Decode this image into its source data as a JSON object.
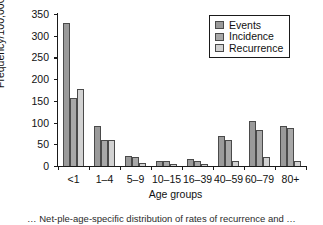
{
  "chart_data": {
    "type": "bar",
    "title": "",
    "xlabel": "Age groups",
    "ylabel": "Frequency/100,000",
    "categories": [
      "<1",
      "1–4",
      "5–9",
      "10–15",
      "16–39",
      "40–59",
      "60–79",
      "80+"
    ],
    "series": [
      {
        "name": "Events",
        "color": "#9a9a9a",
        "values": [
          330,
          93,
          22,
          12,
          16,
          68,
          103,
          92
        ]
      },
      {
        "name": "Incidence",
        "color": "#a8a8a8",
        "values": [
          157,
          61,
          21,
          12,
          12,
          60,
          84,
          87
        ]
      },
      {
        "name": "Recurrence",
        "color": "#d2d2d2",
        "values": [
          177,
          61,
          6,
          5,
          5,
          11,
          21,
          11
        ]
      }
    ],
    "ylim": [
      0,
      350
    ],
    "yticks": [
      0,
      50,
      100,
      150,
      200,
      250,
      300,
      350
    ],
    "ytick_labels": [
      "0",
      "50",
      "100",
      "150",
      "200",
      "250",
      "300",
      "350"
    ],
    "grid": false,
    "legend_position": "top-right"
  },
  "legend": {
    "entries": [
      "Events",
      "Incidence",
      "Recurrence"
    ]
  },
  "caption": {
    "text": "… Net-ple-age-specific distribution of rates of recurrence and …"
  }
}
